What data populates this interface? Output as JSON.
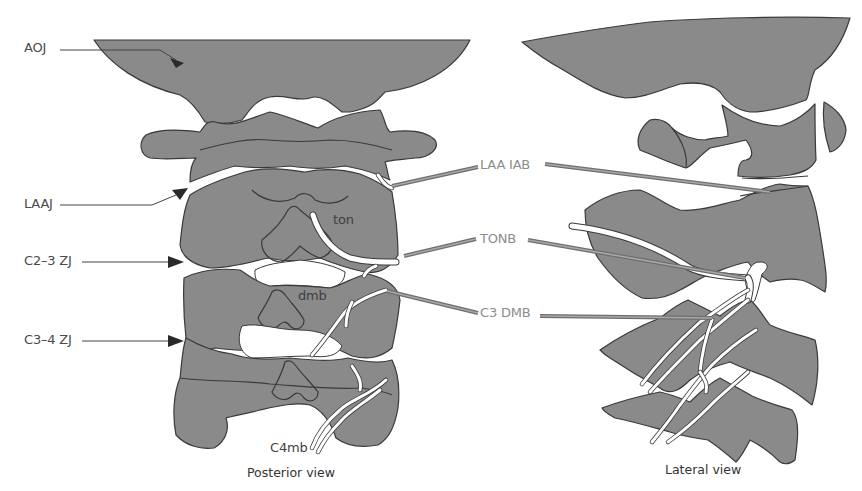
{
  "figure": {
    "views": [
      {
        "id": "posterior",
        "caption": "Posterior view"
      },
      {
        "id": "lateral",
        "caption": "Lateral view"
      }
    ],
    "joint_labels": {
      "aoj": "AOJ",
      "laaj": "LAAJ",
      "c23zj": "C2–3 ZJ",
      "c34zj": "C3–4 ZJ"
    },
    "needle_labels": {
      "laa_iab": "LAA IAB",
      "tonb": "TONB",
      "c3dmb": "C3 DMB"
    },
    "nerve_labels": {
      "ton": "ton",
      "dmb": "dmb",
      "c4mb": "C4mb"
    },
    "colors": {
      "bone_fill": "#8a8a8a",
      "outline": "#3a3a3a",
      "nerve": "#ffffff",
      "needle": "#8c8c8c",
      "label_text": "#4a4a4a",
      "needle_label_text": "#8c8c8c"
    }
  }
}
